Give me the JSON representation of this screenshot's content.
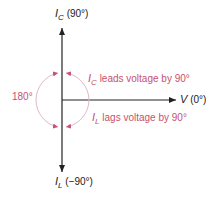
{
  "diagram": {
    "type": "phasor",
    "colors": {
      "axis": "#222222",
      "annotation": "#c8506e",
      "arc": "#e0b8c6"
    },
    "labels": {
      "ic_top": {
        "symbol": "I",
        "sub": "C",
        "angle": "(90°)"
      },
      "v_right": {
        "symbol": "V",
        "angle": "(0°)"
      },
      "il_bottom": {
        "symbol": "I",
        "sub": "L",
        "angle": "(−90°)"
      },
      "leads": {
        "symbol": "I",
        "sub": "C",
        "text": "leads voltage by 90°"
      },
      "lags": {
        "symbol": "I",
        "sub": "L",
        "text": "lags voltage by 90°"
      },
      "angle_180": "180°"
    }
  }
}
